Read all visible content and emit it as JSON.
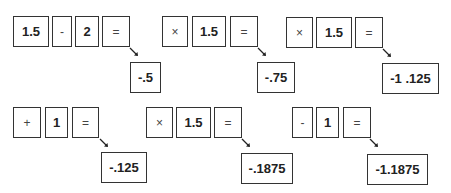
{
  "steps": [
    {
      "keys": [
        "1.5",
        "-",
        "2",
        "="
      ],
      "result": "-.5"
    },
    {
      "keys": [
        "×",
        "1.5",
        "="
      ],
      "result": "-.75"
    },
    {
      "keys": [
        "×",
        "1.5",
        "="
      ],
      "result": "-1 .125"
    },
    {
      "keys": [
        "+",
        "1",
        "="
      ],
      "result": "-.125"
    },
    {
      "keys": [
        "×",
        "1.5",
        "="
      ],
      "result": "-.1875"
    },
    {
      "keys": [
        "-",
        "1",
        "="
      ],
      "result": "-1.1875"
    }
  ],
  "icons": {
    "arrow": "arrow-down-right-icon"
  }
}
